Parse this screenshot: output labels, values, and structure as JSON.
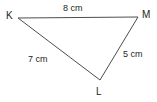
{
  "figure": {
    "kind": "geometry-diagram",
    "shape": "triangle",
    "background_color": "#ffffff",
    "stroke_color": "#4d4d4f",
    "text_color": "#231f20",
    "stroke_width": 1
  },
  "vertices": [
    {
      "id": "K",
      "label": "K",
      "x": 18,
      "y": 18
    },
    {
      "id": "M",
      "label": "M",
      "x": 138,
      "y": 17
    },
    {
      "id": "L",
      "label": "L",
      "x": 100,
      "y": 80
    }
  ],
  "sides": [
    {
      "id": "KM",
      "from": "K",
      "to": "M",
      "label": "8 cm",
      "length": 8,
      "unit": "cm"
    },
    {
      "id": "KL",
      "from": "K",
      "to": "L",
      "label": "7 cm",
      "length": 7,
      "unit": "cm"
    },
    {
      "id": "LM",
      "from": "L",
      "to": "M",
      "label": "5 cm",
      "length": 5,
      "unit": "cm"
    }
  ]
}
